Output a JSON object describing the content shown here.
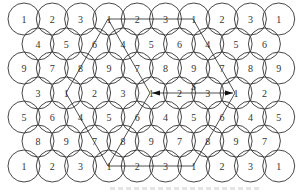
{
  "diagram": {
    "type": "hexagonal-circle-cell-reuse-pattern",
    "circle_radius": 16,
    "stroke_color": "#333333",
    "label_color": "#333333",
    "rows": [
      {
        "y": 19,
        "x_start": 24,
        "labels": [
          "1",
          "2",
          "3",
          "1",
          "2",
          "3",
          "1",
          "2",
          "3",
          "1"
        ]
      },
      {
        "y": 44,
        "x_start": 38,
        "labels": [
          "4",
          "5",
          "6",
          "4",
          "5",
          "6",
          "4",
          "5",
          "6"
        ]
      },
      {
        "y": 68,
        "x_start": 24,
        "labels": [
          "9",
          "7",
          "8",
          "9",
          "7",
          "8",
          "9",
          "7",
          "8",
          "9"
        ]
      },
      {
        "y": 93,
        "x_start": 38,
        "labels": [
          "3",
          "1",
          "2",
          "3",
          "1",
          "2",
          "3",
          "1",
          "2"
        ]
      },
      {
        "y": 117,
        "x_start": 24,
        "labels": [
          "5",
          "6",
          "4",
          "5",
          "6",
          "4",
          "5",
          "6",
          "4",
          "5"
        ]
      },
      {
        "y": 141,
        "x_start": 38,
        "labels": [
          "8",
          "9",
          "7",
          "8",
          "9",
          "7",
          "8",
          "9",
          "7"
        ]
      },
      {
        "y": 166,
        "x_start": 24,
        "labels": [
          "1",
          "2",
          "3",
          "1",
          "2",
          "3",
          "1",
          "2",
          "3",
          "1"
        ]
      }
    ],
    "spacing_x": 28.3,
    "lines": [
      {
        "from": [
          108,
          19
        ],
        "to": [
          193,
          19
        ],
        "kind": "plain"
      },
      {
        "from": [
          108,
          19
        ],
        "to": [
          66,
          93
        ],
        "kind": "plain"
      },
      {
        "from": [
          108,
          19
        ],
        "to": [
          150,
          93
        ],
        "kind": "plain"
      },
      {
        "from": [
          193,
          19
        ],
        "to": [
          235,
          93
        ],
        "kind": "plain"
      },
      {
        "from": [
          66,
          93
        ],
        "to": [
          108,
          166
        ],
        "kind": "plain"
      },
      {
        "from": [
          150,
          93
        ],
        "to": [
          108,
          166
        ],
        "kind": "plain"
      },
      {
        "from": [
          235,
          93
        ],
        "to": [
          193,
          166
        ],
        "kind": "plain"
      },
      {
        "from": [
          108,
          166
        ],
        "to": [
          193,
          166
        ],
        "kind": "plain"
      }
    ],
    "arrows": [
      {
        "from": [
          171,
          93
        ],
        "to": [
          152,
          93
        ]
      },
      {
        "from": [
          214,
          93
        ],
        "to": [
          233,
          93
        ]
      }
    ],
    "arrow_shaft": {
      "from": [
        152,
        93
      ],
      "to": [
        233,
        93
      ]
    },
    "annotation": {
      "text": "S",
      "x": 191,
      "y": 90
    }
  }
}
